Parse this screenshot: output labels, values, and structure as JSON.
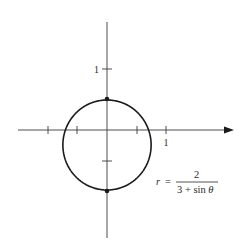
{
  "chart_data": {
    "type": "line",
    "subtype": "polar-curve",
    "title": "",
    "equation": {
      "lhs": "r",
      "equals": "=",
      "numerator": "2",
      "denominator": "3 + sin θ",
      "text": "r = 2 / (3 + sin θ)"
    },
    "axes": {
      "x": {
        "tick_values": [
          -1,
          -0.5,
          0.5,
          1
        ],
        "labeled_ticks": [
          {
            "value": 1,
            "label": "1"
          }
        ],
        "arrow": true,
        "range": [
          -1.5,
          2.1
        ]
      },
      "y": {
        "tick_values": [
          1,
          -0.5
        ],
        "labeled_ticks": [
          {
            "value": 1,
            "label": "1"
          }
        ],
        "arrow": false,
        "range": [
          -1.8,
          1.8
        ]
      }
    },
    "highlighted_points": [
      {
        "name": "top",
        "theta": "π/2",
        "r": 0.5,
        "x": 0,
        "y": 0.5
      },
      {
        "name": "bottom",
        "theta": "3π/2",
        "r": 1,
        "x": 0,
        "y": -1
      }
    ],
    "curve_samples": [
      {
        "theta_deg": 0,
        "r": 0.667,
        "x": 0.667,
        "y": 0
      },
      {
        "theta_deg": 90,
        "r": 0.5,
        "x": 0,
        "y": 0.5
      },
      {
        "theta_deg": 180,
        "r": 0.667,
        "x": -0.667,
        "y": 0
      },
      {
        "theta_deg": 270,
        "r": 1.0,
        "x": 0,
        "y": -1.0
      }
    ],
    "grid": false,
    "legend": null
  },
  "labels": {
    "x_one": "1",
    "y_one": "1",
    "eq_lhs": "r",
    "eq_equals": "=",
    "eq_num": "2",
    "eq_den_prefix": "3 + sin ",
    "eq_den_theta": "θ"
  },
  "colors": {
    "curve": "#1a1a1a",
    "axis": "#3a3a3a",
    "background": "#ffffff"
  }
}
